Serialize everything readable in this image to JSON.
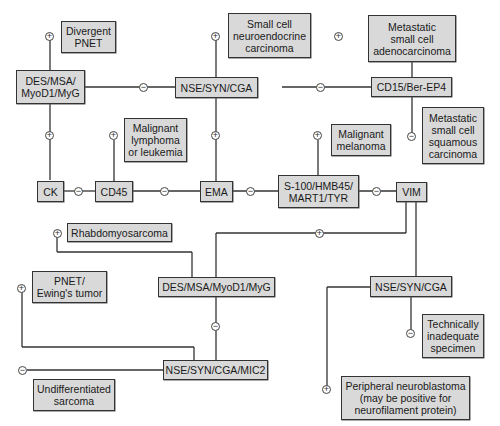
{
  "diagram": {
    "type": "immunohistochemistry decision tree",
    "nodes": {
      "des_top": "DES/MSA/\nMyoD1/MyG",
      "nse_top": "NSE/SYN/CGA",
      "cd15": "CD15/Ber-EP4",
      "ck": "CK",
      "cd45": "CD45",
      "ema": "EMA",
      "s100": "S-100/HMB45/\nMART1/TYR",
      "vim": "VIM",
      "des_mid": "DES/MSA/MyoD1/MyG",
      "nse_mid": "NSE/SYN/CGA",
      "nse_mic2": "NSE/SYN/CGA/MIC2"
    },
    "outcomes": {
      "divergent_pnet": "Divergent\nPNET",
      "small_cell_neuro": "Small cell\nneuroendocrine\ncarcinoma",
      "met_adeno": "Metastatic\nsmall cell\nadenocarcinoma",
      "met_squamous": "Metastatic\nsmall cell\nsquamous\ncarcinoma",
      "lymphoma": "Malignant\nlymphoma\nor leukemia",
      "melanoma": "Malignant\nmelanoma",
      "rhabdo": "Rhabdomyosarcoma",
      "pnet_ewing": "PNET/\nEwing's tumor",
      "inadequate": "Technically\ninadequate\nspecimen",
      "undiff_sarcoma": "Undifferentiated\nsarcoma",
      "peripheral_nb": "Peripheral neuroblastoma\n(may be positive for\nneurofilament protein)"
    },
    "signs": {
      "plus": "+",
      "minus": "−"
    },
    "colors": {
      "box_fill": "#d9d9d9",
      "line": "#333333",
      "background": "#ffffff"
    }
  }
}
